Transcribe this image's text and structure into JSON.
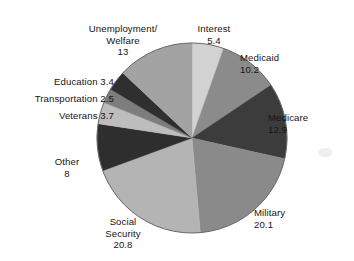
{
  "chart_data": {
    "type": "pie",
    "title": "",
    "subtitle": "",
    "xlabel": "",
    "ylabel": "",
    "legend_position": "none",
    "grid": false,
    "label_format": "name + value",
    "start_angle_deg": 0,
    "direction": "clockwise",
    "total": 100.0,
    "categories": [
      "Interest",
      "Medicaid",
      "Medicare",
      "Military",
      "Social Security",
      "Other",
      "Veterans",
      "Transportation",
      "Education",
      "Unemployment/Welfare"
    ],
    "values": [
      5.4,
      10.2,
      12.9,
      20.1,
      20.8,
      8,
      3.7,
      2.5,
      3.4,
      13
    ],
    "slices": [
      {
        "name": "Interest",
        "label": "Interest",
        "value": 5.4,
        "value_text": "5.4",
        "color": "#d2d2d2",
        "start_deg": 0.0,
        "end_deg": 19.44
      },
      {
        "name": "Medicaid",
        "label": "Medicaid",
        "value": 10.2,
        "value_text": "10.2",
        "color": "#8b8b8b",
        "start_deg": 19.44,
        "end_deg": 56.16
      },
      {
        "name": "Medicare",
        "label": "Medicare",
        "value": 12.9,
        "value_text": "12.9",
        "color": "#3c3c3c",
        "start_deg": 56.16,
        "end_deg": 102.6
      },
      {
        "name": "Military",
        "label": "Military",
        "value": 20.1,
        "value_text": "20.1",
        "color": "#8a8a8a",
        "start_deg": 102.6,
        "end_deg": 174.96
      },
      {
        "name": "Social Security",
        "label": "Social\nSecurity",
        "value": 20.8,
        "value_text": "20.8",
        "color": "#b4b4b4",
        "start_deg": 174.96,
        "end_deg": 249.84
      },
      {
        "name": "Other",
        "label": "Other",
        "value": 8,
        "value_text": "8",
        "color": "#2e2e2e",
        "start_deg": 249.84,
        "end_deg": 278.64
      },
      {
        "name": "Veterans",
        "label": "Veterans",
        "value": 3.7,
        "value_text": "3.7",
        "color": "#bdbdbd",
        "start_deg": 278.64,
        "end_deg": 291.96
      },
      {
        "name": "Transportation",
        "label": "Transportation",
        "value": 2.5,
        "value_text": "2.5",
        "color": "#7d7d7d",
        "start_deg": 291.96,
        "end_deg": 300.96
      },
      {
        "name": "Education",
        "label": "Education",
        "value": 3.4,
        "value_text": "3.4",
        "color": "#2f2f2f",
        "start_deg": 300.96,
        "end_deg": 313.2
      },
      {
        "name": "Unemployment/Welfare",
        "label": "Unemployment/\nWelfare",
        "value": 13,
        "value_text": "13",
        "color": "#a3a3a3",
        "start_deg": 313.2,
        "end_deg": 360.0
      }
    ]
  },
  "labels": {
    "unemployment": {
      "name": "Unemployment/\nWelfare",
      "value": "13"
    },
    "interest": {
      "name": "Interest",
      "value": "5.4"
    },
    "medicaid": {
      "name": "Medicaid",
      "value": "10.2"
    },
    "medicare": {
      "name": "Medicare",
      "value": "12.9"
    },
    "military": {
      "name": "Military",
      "value": "20.1"
    },
    "social_security": {
      "name": "Social\nSecurity",
      "value": "20.8"
    },
    "other": {
      "name": "Other",
      "value": "8"
    },
    "veterans": {
      "text": "Veterans 3.7"
    },
    "transportation": {
      "text": "Transportation 2.5"
    },
    "education": {
      "text": "Education 3.4"
    }
  },
  "geometry": {
    "center_x": 192,
    "center_y": 138,
    "radius": 95
  },
  "colors": {
    "background": "#ffffff",
    "text": "#151515",
    "outline": "#5a5a5a"
  }
}
